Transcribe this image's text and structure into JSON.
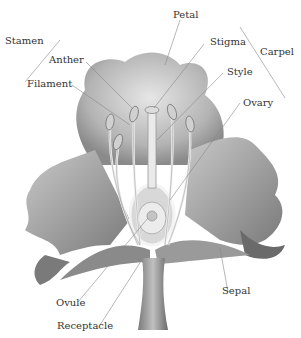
{
  "diagram": {
    "labels": {
      "stamen": "Stamen",
      "anther": "Anther",
      "filament": "Filament",
      "petal": "Petal",
      "stigma": "Stigma",
      "carpel": "Carpel",
      "style": "Style",
      "ovary": "Ovary",
      "ovule": "Ovule",
      "receptacle": "Receptacle",
      "sepal": "Sepal"
    },
    "groups": [
      {
        "name": "Stamen",
        "parts": [
          "Anther",
          "Filament"
        ]
      },
      {
        "name": "Carpel",
        "parts": [
          "Stigma",
          "Style",
          "Ovary"
        ]
      }
    ],
    "colors": {
      "petal_light": "#d4d4d4",
      "petal_mid": "#a8a8a8",
      "petal_dark": "#6e6e6e",
      "leader_line": "#888888",
      "text": "#333333"
    }
  }
}
